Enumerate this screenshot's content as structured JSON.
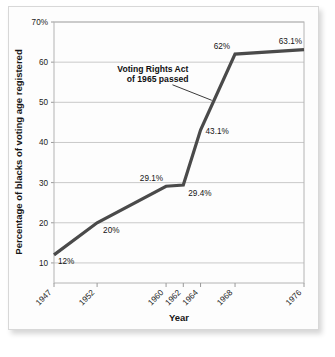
{
  "chart_data": {
    "type": "line",
    "title": "",
    "xlabel": "Year",
    "ylabel": "Percentage of blacks of voting age registered",
    "x": [
      1947,
      1952,
      1960,
      1962,
      1964,
      1968,
      1976
    ],
    "categories": [
      "1947",
      "1952",
      "1960",
      "1962",
      "1964",
      "1968",
      "1976"
    ],
    "values": [
      12,
      20,
      29.1,
      29.4,
      43.1,
      62,
      63.1
    ],
    "point_labels": [
      "12%",
      "20%",
      "29.1%",
      "29.4%",
      "43.1%",
      "62%",
      "63.1%"
    ],
    "series": [
      {
        "name": "Percentage of blacks of voting age registered",
        "values": [
          12,
          20,
          29.1,
          29.4,
          43.1,
          62,
          63.1
        ]
      }
    ],
    "ylim": [
      5,
      70
    ],
    "yticks": [
      10,
      20,
      30,
      40,
      50,
      60,
      70
    ],
    "ytick_labels": [
      "10",
      "20",
      "30",
      "40",
      "50",
      "60",
      "70%"
    ],
    "grid": true,
    "legend": "none",
    "line_color": "#4a4a4a",
    "grid_color": "#c9c9c9",
    "axis_color": "#9a9a9a",
    "annotations": [
      {
        "line1": "Voting Rights Act",
        "line2": "of 1965 passed",
        "target_x": 1965.3,
        "target_y": 50.5
      }
    ]
  },
  "axes": {
    "x_axis_title": "Year",
    "y_axis_title": "Percentage of blacks of voting age registered"
  }
}
